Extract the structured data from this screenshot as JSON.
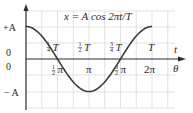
{
  "chart_data": {
    "type": "line",
    "title": "x = A cos 2πt/T",
    "xlabel_top": "t",
    "xlabel_bottom": "θ",
    "ylabel": "x",
    "y_ticks": [
      {
        "label": "+A",
        "value": 1
      },
      {
        "label": "0",
        "value": 0
      },
      {
        "label": "0",
        "value": 0
      },
      {
        "label": "− A",
        "value": -1
      }
    ],
    "x_ticks_time": [
      {
        "frac": "1/4",
        "sym": "T",
        "value": 0.25
      },
      {
        "frac": "1/2",
        "sym": "T",
        "value": 0.5
      },
      {
        "frac": "3/4",
        "sym": "T",
        "value": 0.75
      },
      {
        "frac": "",
        "sym": "T",
        "value": 1.0
      }
    ],
    "x_ticks_angle": [
      {
        "frac": "1/2",
        "sym": "π",
        "value": 0.25
      },
      {
        "frac": "",
        "sym": "π",
        "value": 0.5
      },
      {
        "frac": "3/2",
        "sym": "π",
        "value": 0.75
      },
      {
        "frac": "",
        "sym": "2π",
        "value": 1.0
      }
    ],
    "x": [
      0,
      0.125,
      0.25,
      0.375,
      0.5,
      0.625,
      0.75,
      0.875,
      1.0
    ],
    "values": [
      1,
      0.707,
      0,
      -0.707,
      -1,
      -0.707,
      0,
      0.707,
      1
    ],
    "ylim": [
      -1.3,
      1.3
    ],
    "grid": true,
    "curve_color": "#3a3a3a",
    "grid_color": "#d9d9d9"
  }
}
